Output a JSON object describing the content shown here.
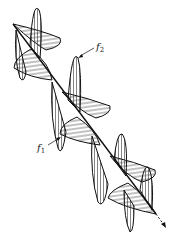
{
  "diagram": {
    "type": "polarized-wave",
    "labels": {
      "f2": {
        "symbol": "f",
        "subscript": "2"
      },
      "f1": {
        "symbol": "f",
        "subscript": "1"
      }
    },
    "colors": {
      "stroke": "#111111",
      "hatch": "#333333",
      "background": "#ffffff"
    }
  }
}
